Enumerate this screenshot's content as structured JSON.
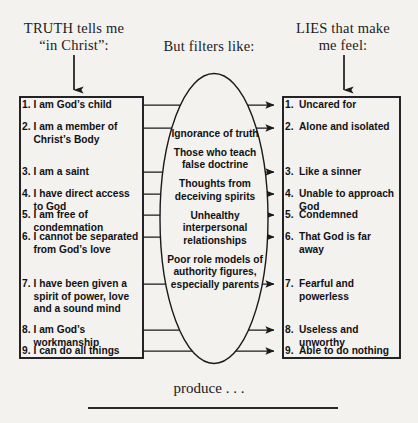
{
  "headers": {
    "truth": "TRUTH tells me\n“in Christ”:",
    "truth_line1": "TRUTH tells me",
    "truth_line2": "“in Christ”:",
    "filter": "But filters like:",
    "lies_line1": "LIES that make",
    "lies_line2": "me feel:"
  },
  "footer": {
    "produce": "produce . . ."
  },
  "truth_list": [
    {
      "num": "1.",
      "text": "I am God’s child"
    },
    {
      "num": "2.",
      "text": "I am a member of Christ’s Body"
    },
    {
      "num": "3.",
      "text": "I am a saint"
    },
    {
      "num": "4.",
      "text": "I have direct access to God"
    },
    {
      "num": "5.",
      "text": "I am free of condemnation"
    },
    {
      "num": "6.",
      "text": "I cannot be separated from God’s love"
    },
    {
      "num": "7.",
      "text": "I have been given a spirit of power, love and a sound mind"
    },
    {
      "num": "8.",
      "text": "I am God’s workmanship"
    },
    {
      "num": "9.",
      "text": "I can do all things"
    }
  ],
  "filters": [
    "Ignorance of truth",
    "Those who teach false doctrine",
    "Thoughts from deceiving spirits",
    "Unhealthy interpersonal relationships",
    "Poor role models of authority figures, especially parents"
  ],
  "lies_list": [
    {
      "num": "1.",
      "text": "Uncared for"
    },
    {
      "num": "2.",
      "text": "Alone and isolated"
    },
    {
      "num": "3.",
      "text": "Like a sinner"
    },
    {
      "num": "4.",
      "text": "Unable to approach God"
    },
    {
      "num": "5.",
      "text": "Condemned"
    },
    {
      "num": "6.",
      "text": "That God is far away"
    },
    {
      "num": "7.",
      "text": "Fearful and powerless"
    },
    {
      "num": "8.",
      "text": "Useless and unworthy"
    },
    {
      "num": "9.",
      "text": "Able to do nothing"
    }
  ],
  "colors": {
    "ink": "#17171a",
    "paper": "#f3f2ee",
    "stroke": "#1a1a1d"
  },
  "layout": {
    "left_box": {
      "x": 20,
      "y": 97,
      "w": 123,
      "h": 261
    },
    "right_box": {
      "x": 283,
      "y": 97,
      "w": 117,
      "h": 261
    },
    "oval": {
      "cx": 214,
      "cy": 218.5,
      "rx": 54,
      "ry": 145
    },
    "connector_rows_left_y": [
      105,
      128,
      172,
      194,
      215,
      237,
      284,
      330,
      351
    ],
    "connector_rows_right_y": [
      105,
      128,
      172,
      194,
      215,
      237,
      284,
      330,
      351
    ],
    "rule": {
      "x1": 88,
      "x2": 338,
      "y": 408
    }
  }
}
